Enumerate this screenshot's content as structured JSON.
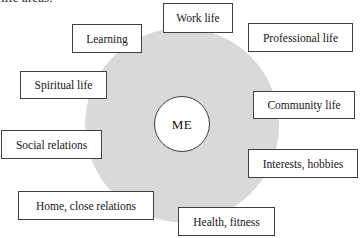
{
  "caption": {
    "fragment": "life areas."
  },
  "diagram": {
    "type": "life-wheel",
    "center": {
      "label": "ME",
      "name": "me-circle"
    },
    "wheel": {
      "fill_color": "#d9d9d9",
      "name": "life-wheel-disc"
    },
    "box_style": {
      "fill_color": "#ffffff",
      "border_color": "#404040"
    },
    "areas": [
      {
        "id": "work-life",
        "label": "Work life"
      },
      {
        "id": "learning",
        "label": "Learning"
      },
      {
        "id": "professional-life",
        "label": "Professional life"
      },
      {
        "id": "spiritual-life",
        "label": "Spiritual life"
      },
      {
        "id": "community-life",
        "label": "Community life"
      },
      {
        "id": "social-relations",
        "label": "Social relations"
      },
      {
        "id": "interests-hobbies",
        "label": "Interests, hobbies"
      },
      {
        "id": "home-close-relations",
        "label": "Home, close relations"
      },
      {
        "id": "health-fitness",
        "label": "Health, fitness"
      }
    ]
  }
}
